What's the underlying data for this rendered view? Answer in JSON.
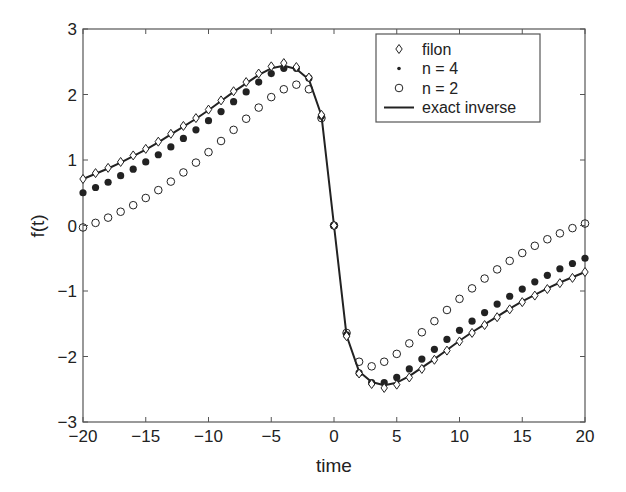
{
  "chart_data": {
    "type": "line",
    "title": "",
    "xlabel": "time",
    "ylabel": "f(t)",
    "xlim": [
      -20,
      20
    ],
    "ylim": [
      -3,
      3
    ],
    "grid": false,
    "legend_position": "upper right",
    "xticks": [
      -20,
      -15,
      -10,
      -5,
      0,
      5,
      10,
      15,
      20
    ],
    "xtick_labels": [
      "−20",
      "−15",
      "−10",
      "−5",
      "0",
      "5",
      "10",
      "15",
      "20"
    ],
    "yticks": [
      -3,
      -2,
      -1,
      0,
      1,
      2,
      3
    ],
    "ytick_labels": [
      "−3",
      "−2",
      "−1",
      "0",
      "1",
      "2",
      "3"
    ],
    "x": [
      -20,
      -19,
      -18,
      -17,
      -16,
      -15,
      -14,
      -13,
      -12,
      -11,
      -10,
      -9,
      -8,
      -7,
      -6,
      -5,
      -4,
      -3,
      -2,
      -1,
      0,
      1,
      2,
      3,
      4,
      5,
      6,
      7,
      8,
      9,
      10,
      11,
      12,
      13,
      14,
      15,
      16,
      17,
      18,
      19,
      20
    ],
    "series": [
      {
        "name": "filon",
        "marker": "diamond-open",
        "values": [
          0.71,
          0.8,
          0.88,
          0.97,
          1.07,
          1.17,
          1.28,
          1.4,
          1.52,
          1.64,
          1.77,
          1.91,
          2.05,
          2.19,
          2.32,
          2.43,
          2.48,
          2.42,
          2.26,
          1.69,
          0,
          -1.69,
          -2.26,
          -2.42,
          -2.48,
          -2.43,
          -2.32,
          -2.19,
          -2.05,
          -1.91,
          -1.77,
          -1.64,
          -1.52,
          -1.4,
          -1.28,
          -1.17,
          -1.07,
          -0.97,
          -0.88,
          -0.8,
          -0.71
        ]
      },
      {
        "name": "n = 4",
        "marker": "dot-filled",
        "values": [
          0.5,
          0.58,
          0.66,
          0.76,
          0.86,
          0.97,
          1.08,
          1.2,
          1.33,
          1.46,
          1.6,
          1.74,
          1.89,
          2.04,
          2.19,
          2.32,
          2.4,
          2.4,
          2.25,
          1.67,
          0,
          -1.67,
          -2.25,
          -2.4,
          -2.4,
          -2.32,
          -2.19,
          -2.04,
          -1.89,
          -1.74,
          -1.6,
          -1.46,
          -1.33,
          -1.2,
          -1.08,
          -0.97,
          -0.86,
          -0.76,
          -0.66,
          -0.58,
          -0.5
        ]
      },
      {
        "name": "n = 2",
        "marker": "circle-open",
        "values": [
          -0.03,
          0.04,
          0.12,
          0.21,
          0.31,
          0.42,
          0.54,
          0.67,
          0.81,
          0.96,
          1.12,
          1.29,
          1.46,
          1.63,
          1.8,
          1.96,
          2.08,
          2.15,
          2.08,
          1.64,
          0,
          -1.64,
          -2.08,
          -2.15,
          -2.08,
          -1.96,
          -1.8,
          -1.63,
          -1.46,
          -1.29,
          -1.12,
          -0.96,
          -0.81,
          -0.67,
          -0.54,
          -0.42,
          -0.31,
          -0.21,
          -0.12,
          -0.04,
          0.03
        ]
      },
      {
        "name": "exact inverse",
        "marker": "solid-line",
        "values": [
          0.71,
          0.79,
          0.87,
          0.96,
          1.06,
          1.16,
          1.27,
          1.39,
          1.51,
          1.63,
          1.76,
          1.9,
          2.04,
          2.17,
          2.3,
          2.4,
          2.44,
          2.39,
          2.23,
          1.68,
          0,
          -1.68,
          -2.23,
          -2.39,
          -2.44,
          -2.4,
          -2.3,
          -2.17,
          -2.04,
          -1.9,
          -1.76,
          -1.63,
          -1.51,
          -1.39,
          -1.27,
          -1.16,
          -1.06,
          -0.96,
          -0.87,
          -0.79,
          -0.71
        ]
      }
    ],
    "legend": [
      "filon",
      "n = 4",
      "n = 2",
      "exact inverse"
    ]
  },
  "colors": {
    "ink": "#222222",
    "axis": "#555555",
    "background": "#ffffff"
  }
}
